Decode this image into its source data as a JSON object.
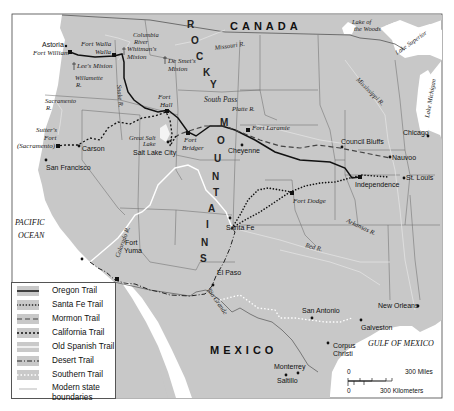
{
  "map": {
    "countries": {
      "canada": "CANADA",
      "mexico": "MEXICO"
    },
    "water_bodies": {
      "pacific_1": "PACIFIC",
      "pacific_2": "OCEAN",
      "gulf": "GULF OF MEXICO",
      "lake_woods_1": "Lake of",
      "lake_woods_2": "the Woods",
      "lake_superior": "Lake Superior",
      "lake_michigan": "Lake Michigan"
    },
    "mountains": {
      "rocky_letters": [
        "R",
        "O",
        "C",
        "K",
        "Y"
      ],
      "mountains_letters": [
        "M",
        "O",
        "U",
        "N",
        "T",
        "A",
        "I",
        "N",
        "S"
      ]
    },
    "rivers": {
      "columbia_1": "Columbia",
      "columbia_2": "River",
      "missouri": "Missouri R.",
      "snake": "Snake R.",
      "willamette_1": "Willamette",
      "willamette_2": "R.",
      "sacramento_1": "Sacramento",
      "sacramento_2": "R.",
      "platte": "Platte R.",
      "mississippi": "Mississippi R.",
      "arkansas": "Arkansas R.",
      "red": "Red R.",
      "colorado": "Colorado R.",
      "rio_grande": "Rio Grande",
      "great_salt_lake_1": "Great Salt",
      "great_salt_lake_2": "Lake"
    },
    "places": {
      "astoria": "Astoria",
      "fort_william": "Fort William",
      "fort_walla_walla_1": "Fort Walla",
      "fort_walla_walla_2": "Walla",
      "whitmans_mission_1": "Whitman's",
      "whitmans_mission_2": "Mision",
      "lees_mission": "Lee's Mision",
      "de_smets_mission_1": "De Smet's",
      "de_smets_mission_2": "Mision",
      "fort_hall_1": "Fort",
      "fort_hall_2": "Hall",
      "south_pass": "South Pass",
      "fort_laramie": "Fort Laramie",
      "fort_bridger_1": "Fort",
      "fort_bridger_2": "Bridger",
      "salt_lake_city": "Salt Lake City",
      "cheyenne": "Cheyenne",
      "sutters_fort_1": "Sutter's",
      "sutters_fort_2": "Fort",
      "sutters_fort_3": "(Sacramento)",
      "carson": "Carson",
      "san_francisco": "San Francisco",
      "council_bluffs": "Council Bluffs",
      "nauvoo": "Nauvoo",
      "chicago": "Chicago",
      "st_louis": "St. Louis",
      "independence": "Independence",
      "fort_dodge": "Fort Dodge",
      "santa_fe": "Santa Fe",
      "fort_yuma_1": "Fort",
      "fort_yuma_2": "Yuma",
      "el_paso": "El Paso",
      "san_antonio": "San Antonio",
      "galveston": "Galveston",
      "new_orleans": "New Orleans",
      "corpus_christi_1": "Corpus",
      "corpus_christi_2": "Christi",
      "monterrey": "Monterrey",
      "saltillo": "Saltillo"
    },
    "scale_bar": {
      "miles_zero": "0",
      "miles_label": "300 Miles",
      "km_zero": "0",
      "km_label": "300 Kilometers"
    },
    "colors": {
      "land": "#c8c8c8",
      "water": "#ffffff",
      "border": "#555555",
      "river": "#e8e8e8",
      "trail": "#111111"
    }
  },
  "legend": {
    "items": [
      {
        "label": "Oregon Trail",
        "style": "solid"
      },
      {
        "label": "Santa Fe Trail",
        "style": "dotted"
      },
      {
        "label": "Mormon Trail",
        "style": "dashed"
      },
      {
        "label": "California Trail",
        "style": "short-dashed"
      },
      {
        "label": "Old Spanish Trail",
        "style": "white-solid"
      },
      {
        "label": "Desert Trail",
        "style": "dash-dot"
      },
      {
        "label": "Southern Trail",
        "style": "white-dotted"
      },
      {
        "label": "Modern state",
        "label2": "boundaries",
        "style": "thin-line"
      }
    ]
  }
}
